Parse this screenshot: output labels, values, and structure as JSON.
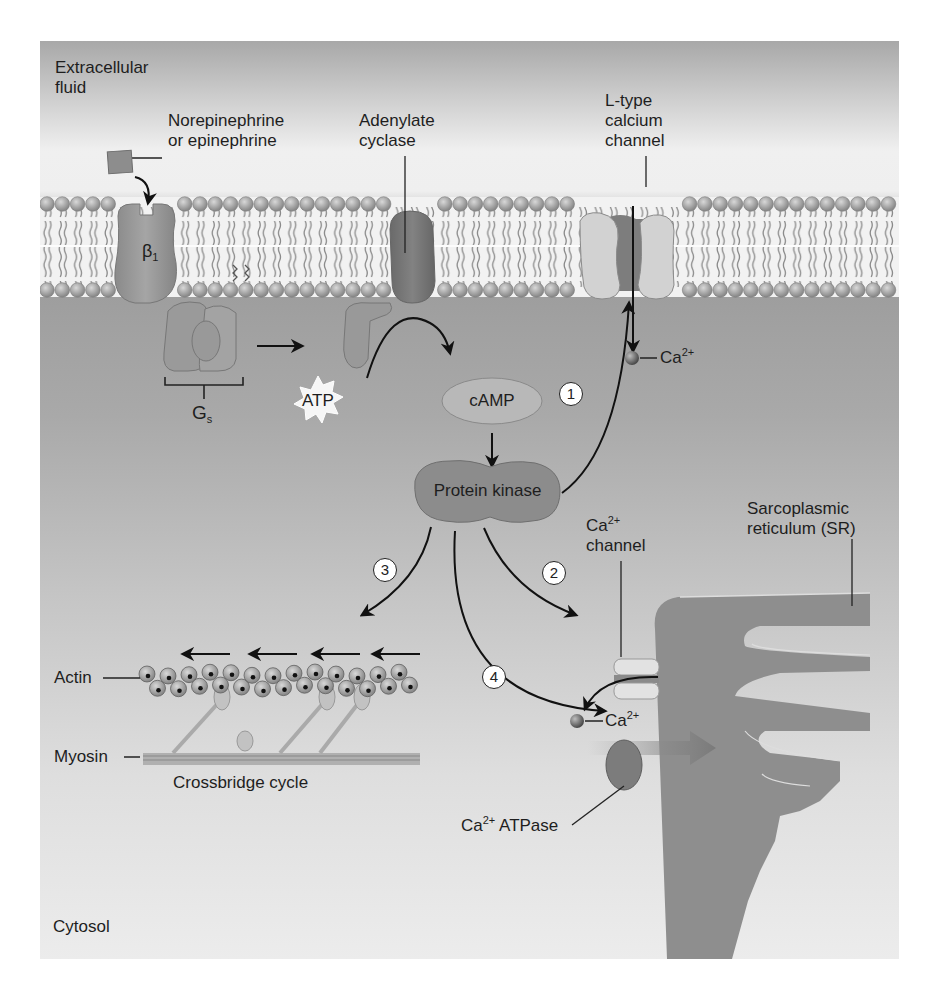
{
  "regions": {
    "extracellular": "Extracellular fluid",
    "extracellular_line1": "Extracellular",
    "extracellular_line2": "fluid",
    "cytosol": "Cytosol"
  },
  "molecules": {
    "ligand_line1": "Norepinephrine",
    "ligand_line2": "or epinephrine",
    "receptor_base": "β",
    "receptor_sub": "1",
    "gprotein_base": "G",
    "gprotein_sub": "s",
    "adenylate_line1": "Adenylate",
    "adenylate_line2": "cyclase",
    "atp": "ATP",
    "camp": "cAMP",
    "protein_kinase": "Protein kinase",
    "ltype_line1": "L-type",
    "ltype_line2": "calcium",
    "ltype_line3": "channel",
    "ca_base": "Ca",
    "ca_sup": "2+",
    "sr_channel_line2": "channel",
    "sr_line1": "Sarcoplasmic",
    "sr_line2": "reticulum (SR)",
    "atpase_suffix": " ATPase",
    "actin": "Actin",
    "myosin": "Myosin",
    "crossbridge": "Crossbridge cycle"
  },
  "steps": [
    "1",
    "2",
    "3",
    "4"
  ],
  "colors": {
    "membrane_head": "#9a9a9a",
    "protein": "#8f8f8f",
    "protein_dark": "#6f6f6f",
    "sr": "#8a8a8a",
    "arrow": "#111111"
  }
}
